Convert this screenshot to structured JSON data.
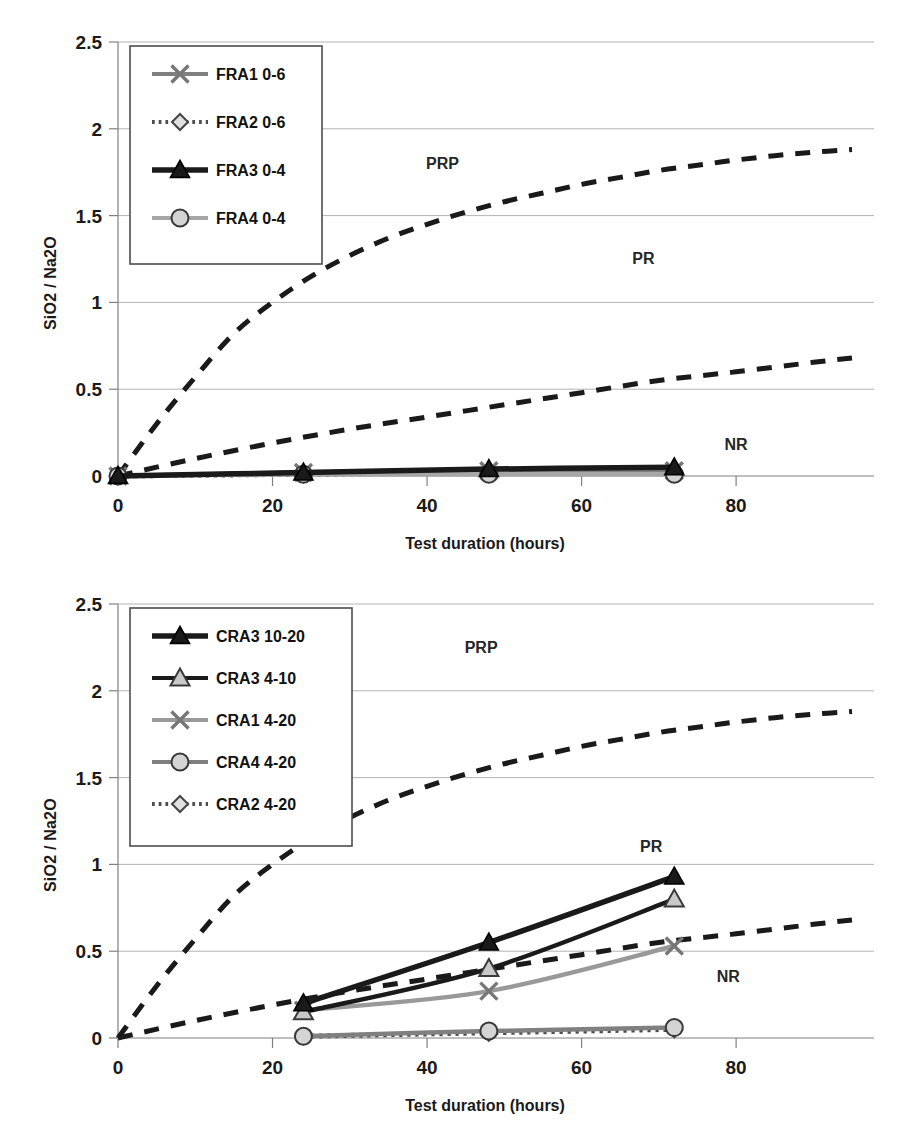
{
  "figure": {
    "charts": [
      {
        "id": "top",
        "axis": {
          "xlabel": "Test duration (hours)",
          "ylabel": "SiO2 / Na2O",
          "xticks": [
            "0",
            "20",
            "40",
            "60",
            "80"
          ],
          "yticks": [
            "0",
            "0.5",
            "1",
            "1.5",
            "2",
            "2.5"
          ]
        },
        "regions": [
          {
            "label": "PRP",
            "x": 42,
            "y": 1.77
          },
          {
            "label": "PR",
            "x": 68,
            "y": 1.22
          },
          {
            "label": "NR",
            "x": 80,
            "y": 0.15
          }
        ],
        "legend": [
          {
            "label": "FRA1 0-6",
            "marker": "x-marker",
            "style": "solid",
            "color": "#808080"
          },
          {
            "label": "FRA2 0-6",
            "marker": "diamond-marker",
            "style": "dotted",
            "color": "#4d4d4d"
          },
          {
            "label": "FRA3 0-4",
            "marker": "triangle-filled-marker",
            "style": "solid",
            "color": "#1a1a1a"
          },
          {
            "label": "FRA4 0-4",
            "marker": "circle-marker",
            "style": "solid",
            "color": "#a6a6a6"
          }
        ]
      },
      {
        "id": "bottom",
        "axis": {
          "xlabel": "Test duration (hours)",
          "ylabel": "SiO2 / Na2O",
          "xticks": [
            "0",
            "20",
            "40",
            "60",
            "80"
          ],
          "yticks": [
            "0",
            "0.5",
            "1",
            "1.5",
            "2",
            "2.5"
          ]
        },
        "regions": [
          {
            "label": "PRP",
            "x": 47,
            "y": 2.22
          },
          {
            "label": "PR",
            "x": 69,
            "y": 1.07
          },
          {
            "label": "NR",
            "x": 79,
            "y": 0.32
          }
        ],
        "legend": [
          {
            "label": "CRA3 10-20",
            "marker": "triangle-filled-marker",
            "style": "solid",
            "color": "#1a1a1a"
          },
          {
            "label": "CRA3 4-10",
            "marker": "triangle-open-marker",
            "style": "solid",
            "color": "#1a1a1a"
          },
          {
            "label": "CRA1 4-20",
            "marker": "x-marker",
            "style": "solid",
            "color": "#999999"
          },
          {
            "label": "CRA4 4-20",
            "marker": "circle-marker",
            "style": "solid",
            "color": "#808080"
          },
          {
            "label": "CRA2 4-20",
            "marker": "diamond-marker",
            "style": "dotted",
            "color": "#4d4d4d"
          }
        ]
      }
    ]
  },
  "chart_data": [
    {
      "type": "line",
      "id": "top",
      "title": "",
      "xlabel": "Test duration (hours)",
      "ylabel": "SiO2 / Na2O",
      "xlim": [
        0,
        95
      ],
      "ylim": [
        0,
        2.5
      ],
      "xticks": [
        0,
        20,
        40,
        60,
        80
      ],
      "yticks": [
        0,
        0.5,
        1,
        1.5,
        2,
        2.5
      ],
      "grid": "horizontal",
      "legend_position": "upper-left-inside",
      "annotations": [
        {
          "text": "PRP",
          "x": 42,
          "y": 1.77
        },
        {
          "text": "PR",
          "x": 68,
          "y": 1.22
        },
        {
          "text": "NR",
          "x": 80,
          "y": 0.15
        }
      ],
      "x": [
        0,
        24,
        48,
        72
      ],
      "series": [
        {
          "name": "FRA1 0-6",
          "values": [
            0,
            0.02,
            0.03,
            0.03
          ],
          "style": "solid",
          "marker": "x",
          "color": "#808080"
        },
        {
          "name": "FRA2 0-6",
          "values": [
            0,
            0.01,
            0.02,
            0.02
          ],
          "style": "dotted",
          "marker": "diamond",
          "color": "#4d4d4d"
        },
        {
          "name": "FRA3 0-4",
          "values": [
            0,
            0.02,
            0.04,
            0.05
          ],
          "style": "solid",
          "marker": "triangle",
          "color": "#1a1a1a"
        },
        {
          "name": "FRA4 0-4",
          "values": [
            0,
            0.01,
            0.01,
            0.01
          ],
          "style": "solid",
          "marker": "circle",
          "color": "#a6a6a6"
        }
      ],
      "boundaries": [
        {
          "name": "PRP/PR boundary",
          "style": "dashed",
          "color": "#1a1a1a",
          "x": [
            0,
            5,
            10,
            15,
            20,
            25,
            30,
            35,
            40,
            45,
            50,
            55,
            60,
            65,
            70,
            75,
            80,
            85,
            90,
            95
          ],
          "y": [
            0,
            0.3,
            0.57,
            0.82,
            1.0,
            1.15,
            1.27,
            1.37,
            1.45,
            1.52,
            1.58,
            1.63,
            1.68,
            1.72,
            1.76,
            1.79,
            1.82,
            1.845,
            1.865,
            1.88
          ]
        },
        {
          "name": "PR/NR boundary",
          "style": "dashed",
          "color": "#1a1a1a",
          "x": [
            0,
            10,
            20,
            30,
            40,
            50,
            60,
            70,
            80,
            90,
            95
          ],
          "y": [
            0,
            0.1,
            0.19,
            0.27,
            0.34,
            0.41,
            0.48,
            0.55,
            0.6,
            0.655,
            0.68
          ]
        }
      ]
    },
    {
      "type": "line",
      "id": "bottom",
      "title": "",
      "xlabel": "Test duration (hours)",
      "ylabel": "SiO2 / Na2O",
      "xlim": [
        0,
        95
      ],
      "ylim": [
        0,
        2.5
      ],
      "xticks": [
        0,
        20,
        40,
        60,
        80
      ],
      "yticks": [
        0,
        0.5,
        1,
        1.5,
        2,
        2.5
      ],
      "grid": "horizontal",
      "legend_position": "upper-left-inside",
      "annotations": [
        {
          "text": "PRP",
          "x": 47,
          "y": 2.22
        },
        {
          "text": "PR",
          "x": 69,
          "y": 1.07
        },
        {
          "text": "NR",
          "x": 79,
          "y": 0.32
        }
      ],
      "x": [
        24,
        48,
        72
      ],
      "series": [
        {
          "name": "CRA3 10-20",
          "values": [
            0.2,
            0.55,
            0.93
          ],
          "style": "solid",
          "marker": "triangle-filled",
          "color": "#1a1a1a"
        },
        {
          "name": "CRA3 4-10",
          "values": [
            0.15,
            0.4,
            0.8
          ],
          "style": "solid",
          "marker": "triangle-open",
          "color": "#1a1a1a"
        },
        {
          "name": "CRA1 4-20",
          "values": [
            0.16,
            0.27,
            0.53
          ],
          "style": "solid",
          "marker": "x",
          "color": "#999999"
        },
        {
          "name": "CRA4 4-20",
          "values": [
            0.01,
            0.04,
            0.06
          ],
          "style": "solid",
          "marker": "circle",
          "color": "#808080"
        },
        {
          "name": "CRA2 4-20",
          "values": [
            0.01,
            0.03,
            0.05
          ],
          "style": "dotted",
          "marker": "diamond",
          "color": "#4d4d4d"
        }
      ],
      "boundaries": [
        {
          "name": "PRP/PR boundary",
          "style": "dashed",
          "color": "#1a1a1a",
          "x": [
            0,
            5,
            10,
            15,
            20,
            25,
            30,
            35,
            40,
            45,
            50,
            55,
            60,
            65,
            70,
            75,
            80,
            85,
            90,
            95
          ],
          "y": [
            0,
            0.3,
            0.57,
            0.82,
            1.0,
            1.15,
            1.27,
            1.37,
            1.45,
            1.52,
            1.58,
            1.63,
            1.68,
            1.72,
            1.76,
            1.79,
            1.82,
            1.845,
            1.865,
            1.88
          ]
        },
        {
          "name": "PR/NR boundary",
          "style": "dashed",
          "color": "#1a1a1a",
          "x": [
            0,
            10,
            20,
            30,
            40,
            50,
            60,
            70,
            80,
            90,
            95
          ],
          "y": [
            0,
            0.1,
            0.19,
            0.27,
            0.34,
            0.41,
            0.48,
            0.55,
            0.6,
            0.655,
            0.68
          ]
        }
      ]
    }
  ]
}
